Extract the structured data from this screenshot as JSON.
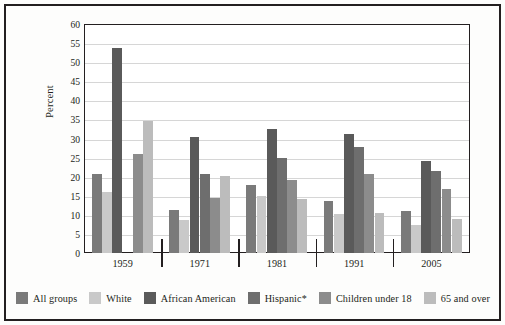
{
  "chart_data": {
    "type": "bar",
    "title": "",
    "subtitle": "",
    "xlabel": "",
    "ylabel": "Percent",
    "ylim": [
      0,
      60
    ],
    "ytick_step": 5,
    "ytick_labels": [
      "0",
      "5",
      "10",
      "15",
      "20",
      "25",
      "30",
      "35",
      "40",
      "45",
      "50",
      "55",
      "60"
    ],
    "grid": true,
    "legend_position": "bottom",
    "categories": [
      "1959",
      "1971",
      "1981",
      "1991",
      "2005"
    ],
    "series": [
      {
        "name": "All groups",
        "color": "#7a7a7a",
        "values": [
          20.8,
          11.2,
          17.7,
          13.6,
          11.0
        ]
      },
      {
        "name": "White",
        "color": "#c9c9c9",
        "values": [
          16.0,
          8.7,
          15.0,
          10.2,
          7.3
        ]
      },
      {
        "name": "African American",
        "color": "#5a5a5a",
        "values": [
          53.8,
          30.5,
          32.5,
          31.1,
          24.2
        ]
      },
      {
        "name": "Hispanic*",
        "color": "#6e6e6e",
        "values": [
          null,
          20.8,
          25.0,
          27.7,
          21.4
        ]
      },
      {
        "name": "Children under 18",
        "color": "#8c8c8c",
        "values": [
          25.9,
          14.3,
          19.0,
          20.8,
          16.9
        ]
      },
      {
        "name": "65 and over",
        "color": "#bcbcbc",
        "values": [
          34.6,
          20.3,
          14.2,
          10.6,
          8.9
        ]
      }
    ]
  },
  "axis": {
    "y_title": "Percent"
  },
  "legend": {
    "items": [
      {
        "label": "All groups"
      },
      {
        "label": "White"
      },
      {
        "label": "African American"
      },
      {
        "label": "Hispanic*"
      },
      {
        "label": "Children under 18"
      },
      {
        "label": "65 and over"
      }
    ]
  }
}
